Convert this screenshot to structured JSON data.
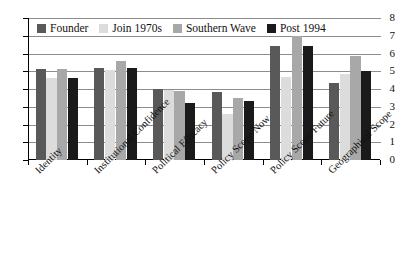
{
  "chart_data": {
    "type": "bar",
    "title": "",
    "subtitle": "",
    "xlabel": "",
    "ylabel": "",
    "ylim": [
      0,
      8
    ],
    "ytick_labels": [
      "8",
      "7",
      "6",
      "5",
      "4",
      "3",
      "2",
      "1",
      "0"
    ],
    "ytick_values": [
      8,
      7,
      6,
      5,
      4,
      3,
      2,
      1,
      0
    ],
    "grid": true,
    "legend_position": "top-left-inside",
    "categories": [
      "Identity",
      "Institutional Confidence",
      "Political Efficacy",
      "Policy Scope Now",
      "Policy Scope Future",
      "Geographical Scope"
    ],
    "series": [
      {
        "name": "Founder",
        "color": "#595959",
        "values": [
          5.1,
          5.2,
          4.0,
          3.85,
          6.45,
          4.35
        ]
      },
      {
        "name": "Join 1970s",
        "color": "#dcdcdc",
        "values": [
          4.6,
          5.05,
          3.95,
          2.6,
          4.65,
          4.85
        ]
      },
      {
        "name": "Southern Wave",
        "color": "#a8a8a8",
        "values": [
          5.15,
          5.6,
          3.9,
          3.5,
          7.05,
          5.85
        ]
      },
      {
        "name": "Post 1994",
        "color": "#1a1a1a",
        "values": [
          4.6,
          5.2,
          3.2,
          3.35,
          6.45,
          5.0
        ]
      }
    ]
  },
  "legend": {
    "items": [
      {
        "label": "Founder",
        "color": "#595959"
      },
      {
        "label": "Join 1970s",
        "color": "#dcdcdc"
      },
      {
        "label": "Southern Wave",
        "color": "#a8a8a8"
      },
      {
        "label": "Post 1994",
        "color": "#1a1a1a"
      }
    ]
  },
  "axis": {
    "gridline_color": "#8d8d8d",
    "axis_color": "#000000"
  }
}
